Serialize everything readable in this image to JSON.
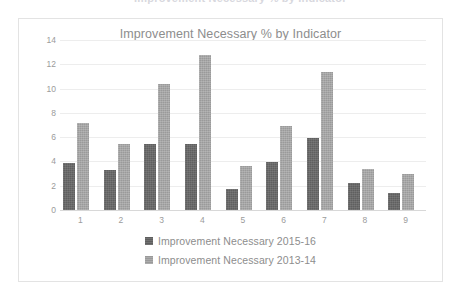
{
  "clipped_header": {
    "ghost_text": "Improvement Necessary % by Indicator"
  },
  "chart_frame": {
    "border_color": "#e3e3e3",
    "background_color": "#ffffff"
  },
  "chart_data": {
    "type": "bar",
    "title": "Improvement Necessary % by Indicator",
    "xlabel": "",
    "ylabel": "",
    "categories": [
      "1",
      "2",
      "3",
      "4",
      "5",
      "6",
      "7",
      "8",
      "9"
    ],
    "ylim": [
      0,
      14
    ],
    "yticks": [
      0,
      2,
      4,
      6,
      8,
      10,
      12,
      14
    ],
    "ytick_labels": [
      "0",
      "2",
      "4",
      "6",
      "8",
      "10",
      "12",
      "14"
    ],
    "grid": true,
    "grid_axis": "y",
    "legend_position": "bottom",
    "series": [
      {
        "name": "Improvement Necessary 2015-16",
        "color": "#5f5f5f",
        "values": [
          3.85,
          3.3,
          5.4,
          5.45,
          1.7,
          3.95,
          5.95,
          2.2,
          1.4
        ]
      },
      {
        "name": "Improvement Necessary 2013-14",
        "color": "#9a9a9a",
        "values": [
          7.2,
          5.4,
          10.4,
          12.8,
          3.65,
          6.9,
          11.4,
          3.35,
          3.0
        ]
      }
    ]
  }
}
